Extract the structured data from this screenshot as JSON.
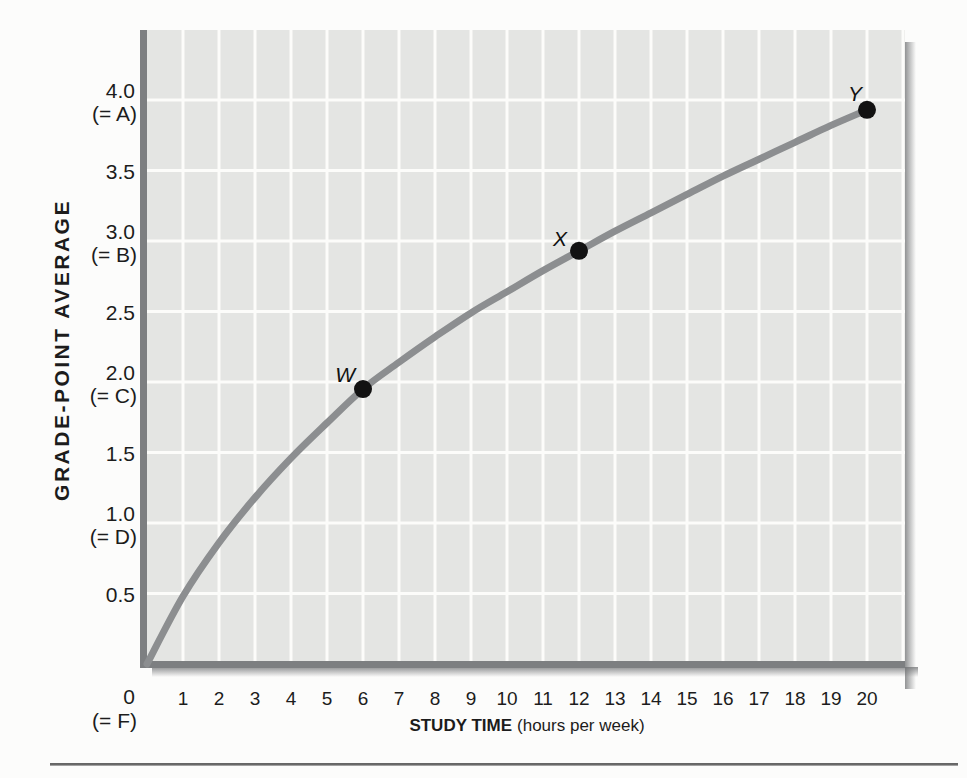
{
  "chart_data": {
    "type": "line",
    "title": "",
    "xlabel": "STUDY TIME (hours per week)",
    "xlabel_bold": "STUDY TIME",
    "xlabel_unit": "(hours per week)",
    "ylabel": "GRADE-POINT AVERAGE",
    "xlim": [
      0,
      21
    ],
    "ylim": [
      0,
      4.45
    ],
    "grid": "on",
    "legend": "none",
    "xticks": [
      1,
      2,
      3,
      4,
      5,
      6,
      7,
      8,
      9,
      10,
      11,
      12,
      13,
      14,
      15,
      16,
      17,
      18,
      19,
      20
    ],
    "yticks": [
      {
        "value": 4.0,
        "label": "4.0",
        "grade": "(= A)"
      },
      {
        "value": 3.5,
        "label": "3.5"
      },
      {
        "value": 3.0,
        "label": "3.0",
        "grade": "(= B)"
      },
      {
        "value": 2.5,
        "label": "2.5"
      },
      {
        "value": 2.0,
        "label": "2.0",
        "grade": "(= C)"
      },
      {
        "value": 1.5,
        "label": "1.5"
      },
      {
        "value": 1.0,
        "label": "1.0",
        "grade": "(= D)"
      },
      {
        "value": 0.5,
        "label": "0.5"
      },
      {
        "value": 0,
        "label": "0",
        "grade": "(= F)",
        "below_axis": true
      }
    ],
    "curve": {
      "x": [
        0,
        1,
        2,
        3,
        4,
        5,
        6,
        7,
        8,
        9,
        10,
        11,
        12,
        13,
        14,
        15,
        16,
        17,
        18,
        19,
        20
      ],
      "y": [
        0,
        0.48,
        0.86,
        1.18,
        1.46,
        1.71,
        1.95,
        2.14,
        2.32,
        2.49,
        2.64,
        2.79,
        2.93,
        3.07,
        3.2,
        3.33,
        3.46,
        3.58,
        3.7,
        3.82,
        3.93
      ]
    },
    "points": [
      {
        "label": "W",
        "x": 6,
        "y": 2.0
      },
      {
        "label": "X",
        "x": 12,
        "y": 3.0
      },
      {
        "label": "Y",
        "x": 20,
        "y": 4.0
      }
    ]
  },
  "colors": {
    "background": "#fcfcfb",
    "panel": "#e4e5e3",
    "gridline": "#fcfcfa",
    "axis": "#7d7f81",
    "curve": "#8c8e90",
    "point": "#121212",
    "text": "#1c1c1c",
    "shadow": "#6e7072",
    "rule_dark": "#646464",
    "rule_light": "#c2c2c2"
  }
}
